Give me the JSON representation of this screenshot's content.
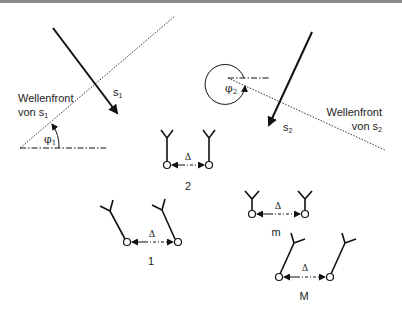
{
  "diagram": {
    "colors": {
      "line": "#111111",
      "text": "#222222",
      "topbar": "#8a8a8a"
    },
    "source1": {
      "label": "s",
      "subscript": "1",
      "wavefront_label_line1": "Wellenfront",
      "wavefront_label_line2": "von s",
      "wavefront_label_sub": "1",
      "angle_label": "φ",
      "angle_sub": "1"
    },
    "source2": {
      "label": "s",
      "subscript": "2",
      "wavefront_label_line1": "Wellenfront",
      "wavefront_label_line2": "von s",
      "wavefront_label_sub": "2",
      "angle_label": "φ",
      "angle_sub": "2"
    },
    "antenna_pairs": [
      {
        "id": "2",
        "label": "2",
        "spacing_label": "Δ"
      },
      {
        "id": "1",
        "label": "1",
        "spacing_label": "Δ"
      },
      {
        "id": "m",
        "label": "m",
        "spacing_label": "Δ"
      },
      {
        "id": "M",
        "label": "M",
        "spacing_label": "Δ"
      }
    ]
  }
}
